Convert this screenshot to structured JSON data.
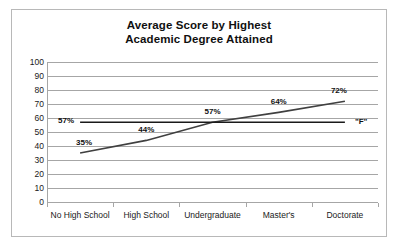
{
  "chart_data": {
    "type": "line",
    "title": "Average Score by Highest Academic Degree Attained",
    "title_lines": [
      "Average Score by Highest",
      "Academic Degree Attained"
    ],
    "xlabel": "",
    "ylabel": "",
    "ylim": [
      0,
      100
    ],
    "ytick_labels": [
      "100",
      "90",
      "80",
      "70",
      "60",
      "50",
      "40",
      "30",
      "20",
      "10",
      "0"
    ],
    "ytick_values": [
      100,
      90,
      80,
      70,
      60,
      50,
      40,
      30,
      20,
      10,
      0
    ],
    "grid": true,
    "legend": "none",
    "categories": [
      "No High School",
      "High School",
      "Undergraduate",
      "Master's",
      "Doctorate"
    ],
    "series": [
      {
        "name": "Average Score",
        "values": [
          35,
          44,
          57,
          64,
          72
        ],
        "data_labels": [
          "35%",
          "44%",
          "57%",
          "64%",
          "72%"
        ],
        "color": "#404040",
        "end_label": ""
      },
      {
        "name": "F",
        "values": [
          57,
          57,
          57,
          57,
          57
        ],
        "data_labels": [
          "57%",
          "",
          "",
          "",
          ""
        ],
        "color": "#1a1a1a",
        "end_label": "\"F\""
      }
    ]
  },
  "colors": {
    "frame_border": "#b8b8b8",
    "gridline": "#a6a6a6",
    "axis": "#a6a6a6",
    "text": "#1a1a1a",
    "series_rising": "#404040",
    "series_flat": "#1a1a1a"
  }
}
